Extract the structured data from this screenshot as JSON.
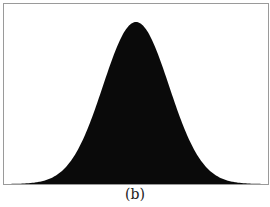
{
  "caption": "(b)",
  "colors": {
    "fill": "#0a0a0a",
    "frame": "#9a9a9a",
    "background": "#ffffff"
  },
  "chart_data": {
    "type": "area",
    "title": "",
    "caption": "(b)",
    "xlabel": "",
    "ylabel": "",
    "x": [
      -4,
      -3,
      -2,
      -1.5,
      -1,
      -0.5,
      0,
      0.5,
      1,
      1.5,
      2,
      3,
      4
    ],
    "values": [
      0.0003,
      0.011,
      0.135,
      0.325,
      0.607,
      0.882,
      1.0,
      0.882,
      0.607,
      0.325,
      0.135,
      0.011,
      0.0003
    ],
    "series": [
      {
        "name": "density",
        "values": [
          0.0003,
          0.011,
          0.135,
          0.325,
          0.607,
          0.882,
          1.0,
          0.882,
          0.607,
          0.325,
          0.135,
          0.011,
          0.0003
        ]
      }
    ],
    "xlim": [
      -4,
      4
    ],
    "ylim": [
      0,
      1.0
    ],
    "grid": false,
    "legend": "none"
  }
}
